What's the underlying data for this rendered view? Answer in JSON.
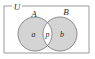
{
  "figure": {
    "type": "venn-diagram",
    "title": "",
    "universe": {
      "label": "U",
      "name": "universal-set-rectangle"
    },
    "sets": [
      {
        "id": "A",
        "label": "A",
        "position": "left"
      },
      {
        "id": "B",
        "label": "B",
        "position": "right"
      }
    ],
    "regions": [
      {
        "id": "a",
        "label": "a",
        "meaning": "A only",
        "shaded": true
      },
      {
        "id": "p",
        "label": "p",
        "meaning": "A intersect B",
        "shaded": false
      },
      {
        "id": "b",
        "label": "b",
        "meaning": "B only",
        "shaded": true
      }
    ],
    "colors": {
      "background": "#ffffff",
      "rectangle_stroke": "#9a9a9a",
      "circle_stroke": "#808080",
      "circle_fill": "#d4d4d4",
      "intersection_fill": "#ffffff",
      "text": "#2b2b2b"
    },
    "geometry": {
      "rect": {
        "x": 4,
        "y": 6,
        "width": 85,
        "height": 47
      },
      "circle_a": {
        "cx": 35,
        "cy": 34,
        "r": 17
      },
      "circle_b": {
        "cx": 60,
        "cy": 34,
        "r": 17
      }
    }
  }
}
